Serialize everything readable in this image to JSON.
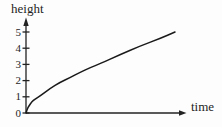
{
  "figure": {
    "background": "#fdfdfd"
  },
  "chart_data": {
    "type": "line",
    "title": "",
    "xlabel": "time",
    "ylabel": "height",
    "xticks": [],
    "yticks": [
      0,
      1,
      2,
      3,
      4,
      5
    ],
    "ytick_labels": [
      "0",
      "1",
      "2",
      "3",
      "4",
      "5"
    ],
    "xlim": [
      0,
      1
    ],
    "ylim": [
      0,
      5.7
    ],
    "grid": false,
    "legend": false,
    "series": [
      {
        "name": "height-vs-time-curve",
        "points": [
          [
            0.0,
            0.0
          ],
          [
            0.008,
            0.25
          ],
          [
            0.02,
            0.45
          ],
          [
            0.04,
            0.7
          ],
          [
            0.06,
            0.85
          ],
          [
            0.094,
            1.05
          ],
          [
            0.16,
            1.5
          ],
          [
            0.23,
            1.9
          ],
          [
            0.3,
            2.2
          ],
          [
            0.36,
            2.5
          ],
          [
            0.43,
            2.8
          ],
          [
            0.5,
            3.05
          ],
          [
            0.63,
            3.6
          ],
          [
            0.77,
            4.15
          ],
          [
            0.9,
            4.6
          ],
          [
            1.0,
            5.0
          ]
        ]
      }
    ],
    "colors": {
      "axis": "#222222",
      "curve": "#1a1a1a",
      "text": "#1f1f1f"
    }
  }
}
